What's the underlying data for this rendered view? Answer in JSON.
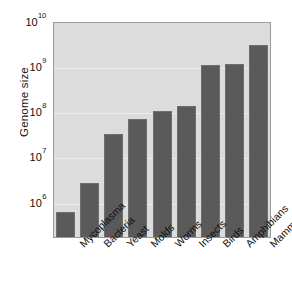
{
  "chart_data": {
    "type": "bar",
    "title": "",
    "subtitle": "",
    "xlabel": "",
    "ylabel": "Genome size",
    "yscale": "log",
    "ylim": [
      165000,
      10000000000
    ],
    "grid": true,
    "legend": "none",
    "categories": [
      "Mycoplasma",
      "Bacteria",
      "Yeast",
      "Molds",
      "Worms",
      "Insects",
      "Birds",
      "Amphibians",
      "Mammals"
    ],
    "values": [
      600000,
      2600000,
      32000000,
      66000000,
      100000000,
      130000000,
      1050000000,
      1100000000,
      2900000000
    ],
    "ytick_values": [
      1000000,
      10000000,
      100000000,
      1000000000,
      10000000000
    ],
    "yticks": [
      {
        "mantissa": "10",
        "exponent": "10"
      },
      {
        "mantissa": "10",
        "exponent": "9"
      },
      {
        "mantissa": "10",
        "exponent": "8"
      },
      {
        "mantissa": "10",
        "exponent": "7"
      },
      {
        "mantissa": "10",
        "exponent": "6"
      }
    ],
    "colors": {
      "bar_fill": "#5a5a5a",
      "bar_edge": "#6e6e6e",
      "plot_background": "#dcdcdc",
      "gridline": "#ececec",
      "axis_border": "#9a9a9a",
      "text": "#111111",
      "figure_background": "#ffffff"
    }
  }
}
